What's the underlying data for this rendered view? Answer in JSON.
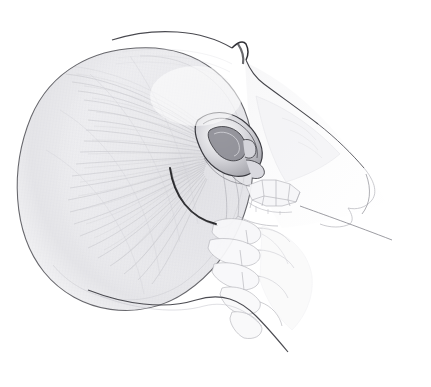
{
  "document": {
    "type": "anatomical-illustration",
    "medium": "graphite-pencil-drawing",
    "title": "Lateral view of the head with superficial musculature, ear, mandible and cervical spine",
    "orientation": "lateral-profile-facing-right",
    "background_color": "#ffffff",
    "paper_color": "#ffffff",
    "frame_border_color": "#f1f1f3",
    "ink_color": "#3a3a3d",
    "shading_color": "#c9c9cd",
    "faint_line_color": "#b9b9be"
  },
  "frame": {
    "x": 13,
    "y": 15,
    "width": 412,
    "height": 353
  },
  "anatomy": {
    "regions": [
      {
        "id": "cranial-muscle-mass",
        "label": "Enlarged cranial / temporalis muscle mass",
        "description": "Large ovoid mass occupying the left two-thirds of the drawing, rendered with fine radiating fiber hatching fanning from the ear toward the posterior margin.",
        "center_x": 135,
        "center_y": 175,
        "radius_x": 120,
        "radius_y": 125,
        "outline_stroke": "#55555a",
        "fill_tone": "#e9e9ec"
      },
      {
        "id": "ear-auricle",
        "label": "Auricle (external ear)",
        "description": "Detailed pinna with helix, antihelix, concha, tragus and lobule.",
        "center_x": 228,
        "center_y": 148,
        "width": 72,
        "height": 60,
        "outline_stroke": "#3a3a3d"
      },
      {
        "id": "forehead-brow-profile",
        "label": "Forehead and supraorbital brow profile",
        "description": "Dark profile contour running from the vertex down across the glabella notch to the nasal bridge.",
        "outline_stroke": "#45454a"
      },
      {
        "id": "face-profile",
        "label": "Facial profile (nose, lips, chin)",
        "description": "Very faint profile contour of nose, upper lip and chin on the right.",
        "outline_stroke": "#b4b4b9"
      },
      {
        "id": "maxilla-teeth",
        "label": "Maxillary and mandibular teeth",
        "description": "Row of faintly outlined molar and premolar crowns in the jaw region.",
        "count": 9,
        "outline_stroke": "#a8a8ae"
      },
      {
        "id": "mandible",
        "label": "Mandible / mandibular ramus",
        "description": "Ghosted outline of the jaw bone below and anterior to the ear.",
        "outline_stroke": "#adadb3"
      },
      {
        "id": "cervical-vertebrae",
        "label": "Cervical vertebrae",
        "description": "Stack of faintly drawn cervical vertebral bodies and spinous processes descending below the skull base.",
        "count": 5,
        "outline_stroke": "#b0b0b6"
      },
      {
        "id": "incision-arc",
        "label": "Dark curved incision / muscle border line",
        "description": "A prominent dark arc sweeping from the mid-mass down and to the right toward the mandibular angle.",
        "outline_stroke": "#2d2d30"
      },
      {
        "id": "neck-shoulder-contour",
        "label": "Posterior neck and shoulder contour",
        "description": "Long dark line descending from the inferior margin of the mass toward the lower right shoulder.",
        "outline_stroke": "#4a4a4f"
      },
      {
        "id": "chin-neck-line",
        "label": "Anterior chin to neck line",
        "description": "Straight faint line extending from the chin downward and to the right beyond the figure.",
        "outline_stroke": "#8d8d93"
      }
    ],
    "hatching": {
      "label": "Radiating muscle fiber hatching",
      "pattern": "fine curved strokes fanning outward from the auricular region",
      "stroke_color": "#c4c4c9",
      "density": "high"
    }
  }
}
